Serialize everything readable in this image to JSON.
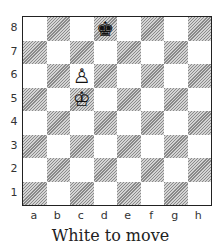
{
  "diagram": {
    "type": "chess-board",
    "caption": "White to move",
    "ranks": [
      "8",
      "7",
      "6",
      "5",
      "4",
      "3",
      "2",
      "1"
    ],
    "files": [
      "a",
      "b",
      "c",
      "d",
      "e",
      "f",
      "g",
      "h"
    ],
    "pieces": [
      {
        "square": "d8",
        "color": "black",
        "piece": "king",
        "glyph": "♚"
      },
      {
        "square": "c6",
        "color": "white",
        "piece": "pawn",
        "glyph": "♙"
      },
      {
        "square": "c5",
        "color": "white",
        "piece": "king",
        "glyph": "♔"
      }
    ],
    "colors": {
      "light_square": "#ffffff",
      "dark_square_hatch": "#8a8a8a",
      "border": "#222222"
    }
  }
}
